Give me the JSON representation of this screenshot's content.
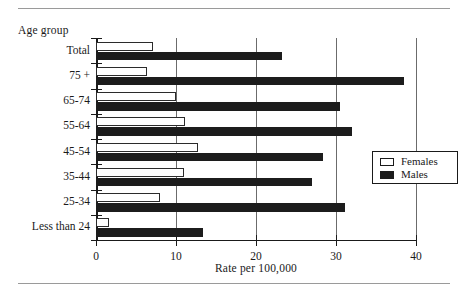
{
  "figure": {
    "y_axis_title": "Age group",
    "x_axis_title": "Rate per 100,000"
  },
  "legend": {
    "entries": [
      {
        "label": "Females",
        "swatch": "open-square-white",
        "color": "#ffffff"
      },
      {
        "label": "Males",
        "swatch": "filled-square-black",
        "color": "#1c1c1c"
      }
    ]
  },
  "chart_data": {
    "type": "bar",
    "orientation": "horizontal",
    "title": "",
    "xlabel": "Rate per 100,000",
    "ylabel": "Age group",
    "xlim": [
      0,
      40
    ],
    "xticks": [
      "0",
      "10",
      "20",
      "30",
      "40"
    ],
    "xtick_values": [
      0,
      10,
      20,
      30,
      40
    ],
    "grid": "vertical gridlines at 10, 20, 30, 40",
    "legend_position": "right-middle",
    "categories": [
      "Total",
      "75 +",
      "65-74",
      "55-64",
      "45-54",
      "35-44",
      "25-34",
      "Less than 24"
    ],
    "series": [
      {
        "name": "Females",
        "values": [
          7.1,
          6.4,
          10.0,
          11.1,
          12.8,
          11.0,
          8.0,
          1.6
        ]
      },
      {
        "name": "Males",
        "values": [
          23.3,
          38.5,
          30.5,
          32.0,
          28.4,
          27.0,
          31.1,
          13.4
        ]
      }
    ]
  }
}
